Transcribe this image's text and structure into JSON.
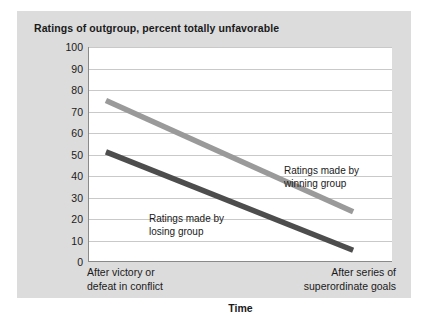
{
  "chart_data": {
    "type": "line",
    "title": "Ratings of outgroup, percent totally unfavorable",
    "xlabel": "Time",
    "ylabel": "",
    "categories": [
      "After victory or defeat in conflict",
      "After series of superordinate goals"
    ],
    "xtick_lines": [
      [
        "After victory or",
        "defeat in conflict"
      ],
      [
        "After series of",
        "superordinate goals"
      ]
    ],
    "ylim": [
      0,
      100
    ],
    "yticks": [
      100,
      90,
      80,
      70,
      60,
      50,
      40,
      30,
      20,
      10,
      0
    ],
    "grid": "horizontal",
    "legend": "none",
    "series": [
      {
        "name": "Ratings made by winning group",
        "values": [
          75,
          23
        ],
        "color": "#9a9a9a"
      },
      {
        "name": "Ratings made by losing group",
        "values": [
          51,
          5
        ],
        "color": "#4d4d4d"
      }
    ],
    "annotations": [
      {
        "id": "winning",
        "lines": [
          "Ratings made by",
          "winning group"
        ]
      },
      {
        "id": "losing",
        "lines": [
          "Ratings made by",
          "losing group"
        ]
      }
    ]
  },
  "colors": {
    "figure_background": "#dcdcdc",
    "plot_background": "#ffffff",
    "gridline": "#c9c9c9",
    "axis": "#8a8a8a",
    "text": "#1a1a1a"
  }
}
